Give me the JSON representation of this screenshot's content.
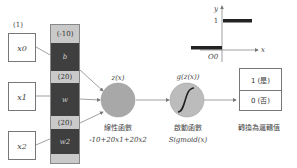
{
  "diagram": {
    "type": "logistic-neuron",
    "bias_input_label": "(1)",
    "inputs": [
      {
        "label": "x0"
      },
      {
        "label": "x1"
      },
      {
        "label": "x2"
      }
    ],
    "weights": [
      {
        "value": "(-10)",
        "symbol": "b"
      },
      {
        "value": "(20)",
        "symbol": "w"
      },
      {
        "value": "(20)",
        "symbol": "w2"
      }
    ],
    "linear_node": {
      "label": "z(x)",
      "caption": "線性函數",
      "formula": "-10+20x1+20x2"
    },
    "activation_node": {
      "label": "g(z(x))",
      "caption": "啟動函數",
      "formula": "Sigmoid(x)"
    },
    "output": {
      "options": [
        "1 (是)",
        "0 (否)"
      ],
      "caption": "轉換為邏輯值"
    },
    "step_plot": {
      "y_axis_label": "y",
      "x_axis_label": "x",
      "y_tick": "1",
      "origin_label": "O0"
    },
    "colors": {
      "dark_segment": "#3f3f3f",
      "light_segment": "#c9c9c9",
      "node_fill": "#a8a8a8",
      "line": "#777777"
    }
  }
}
